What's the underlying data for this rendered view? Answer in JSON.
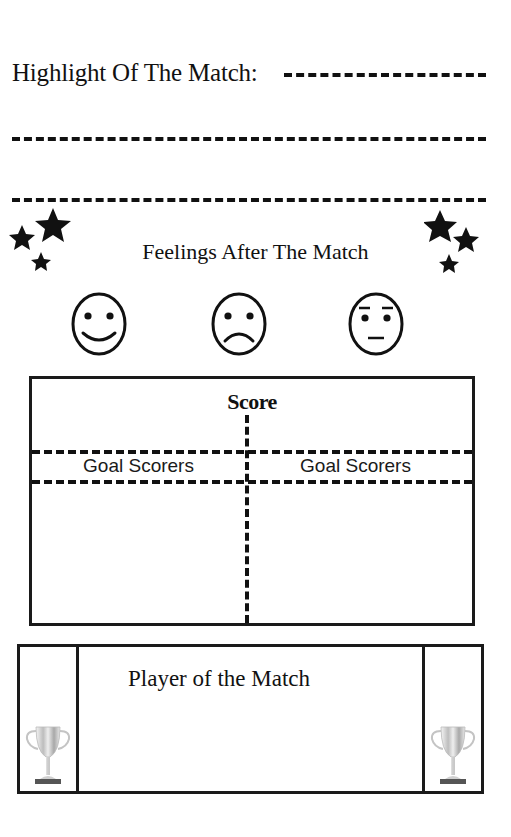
{
  "highlight": {
    "title": "Highlight Of The Match:",
    "blank_lines": 3
  },
  "feelings": {
    "title": "Feelings After The Match",
    "faces": [
      {
        "name": "happy-face-icon",
        "mood": "happy"
      },
      {
        "name": "sad-face-icon",
        "mood": "sad"
      },
      {
        "name": "neutral-face-icon",
        "mood": "neutral"
      }
    ],
    "decorations": [
      "stars-left",
      "stars-right"
    ]
  },
  "score": {
    "title": "Score",
    "left_column_label": "Goal Scorers",
    "right_column_label": "Goal Scorers"
  },
  "player_of_match": {
    "title": "Player of the Match",
    "icons": [
      "trophy-left",
      "trophy-right"
    ]
  },
  "colors": {
    "ink": "#111111",
    "background": "#ffffff",
    "trophy_silver": "#c8c8c8"
  }
}
